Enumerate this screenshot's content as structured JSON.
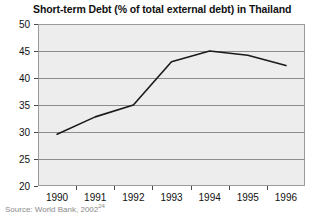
{
  "chart_data": {
    "type": "line",
    "title": "Short-term Debt (% of total external debt) in Thailand",
    "xlabel": "",
    "ylabel": "",
    "categories": [
      "1990",
      "1991",
      "1992",
      "1993",
      "1994",
      "1995",
      "1996"
    ],
    "values": [
      29.6,
      32.8,
      35.0,
      43.0,
      45.0,
      44.2,
      42.3
    ],
    "ylim": [
      20,
      50
    ],
    "yticks": [
      20,
      25,
      30,
      35,
      40,
      45,
      50
    ],
    "ytick_labels": [
      "20",
      "25",
      "30",
      "35",
      "40",
      "45",
      "50"
    ],
    "grid": true,
    "grid_axis": "y",
    "legend": false,
    "legend_position": "none",
    "line_color": "#1a1a1a",
    "plot_background": "#ededed",
    "figure_background": "#ffffff",
    "grid_color": "#8c8c8c",
    "axis_color": "#9a9a9a"
  },
  "source": {
    "text": "Source: World Bank, 2002",
    "superscript": "24"
  }
}
